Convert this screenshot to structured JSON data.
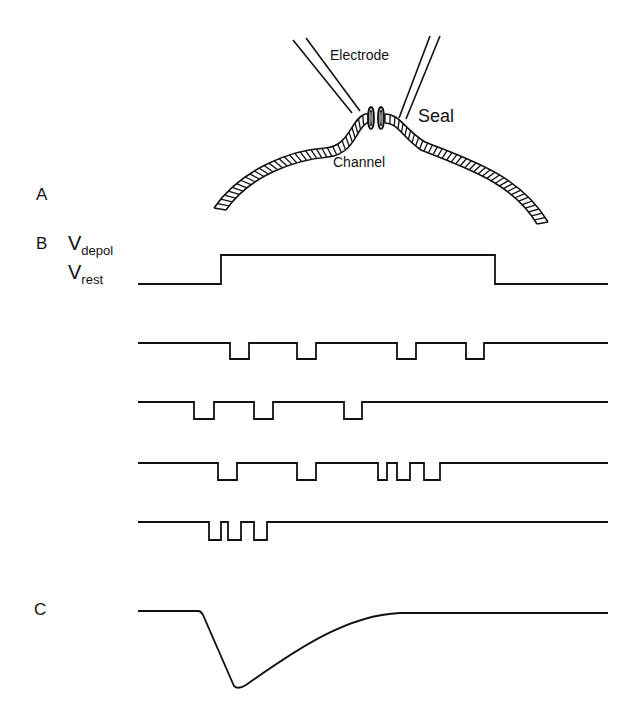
{
  "figure": {
    "panel_a": {
      "label": "A",
      "electrode_label": "Electrode",
      "seal_label": "Seal",
      "channel_label": "Channel"
    },
    "panel_b": {
      "label": "B",
      "v_depol": {
        "main": "V",
        "sub": "depol"
      },
      "v_rest": {
        "main": "V",
        "sub": "rest"
      },
      "voltage_step": {
        "x_start": 138,
        "x_up": 221,
        "x_down": 495,
        "x_end": 608,
        "y_rest": 284,
        "y_depol": 255
      },
      "channel_traces": [
        {
          "baseline_y": 343,
          "depth": 16,
          "openings": [
            [
              230,
              249
            ],
            [
              297,
              316
            ],
            [
              397,
              416
            ],
            [
              466,
              484
            ]
          ]
        },
        {
          "baseline_y": 402,
          "depth": 17,
          "openings": [
            [
              194,
              214
            ],
            [
              254,
              273
            ],
            [
              344,
              362
            ]
          ]
        },
        {
          "baseline_y": 463,
          "depth": 17,
          "openings": [
            [
              218,
              237
            ],
            [
              297,
              316
            ],
            [
              378,
              387
            ],
            [
              397,
              410
            ],
            [
              424,
              440
            ]
          ]
        },
        {
          "baseline_y": 522,
          "depth": 18,
          "openings": [
            [
              209,
              221
            ],
            [
              228,
              241
            ],
            [
              254,
              267
            ]
          ]
        }
      ],
      "trace_x_start": 138,
      "trace_x_end": 608
    },
    "panel_c": {
      "label": "C",
      "ensemble_current": {
        "x_start": 138,
        "x_onset": 201,
        "baseline_y": 611,
        "x_min": 238,
        "y_min": 688,
        "x_recovered": 400,
        "y_recovered": 613,
        "x_end": 608
      }
    }
  },
  "colors": {
    "ink": "#111111",
    "background": "#ffffff"
  }
}
